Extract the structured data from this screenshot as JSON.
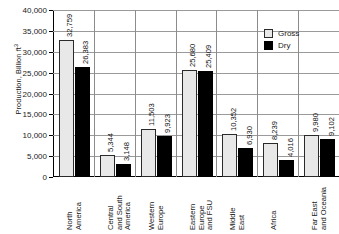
{
  "chart_data": {
    "type": "bar",
    "title": "",
    "xlabel": "",
    "ylabel": "Production, Billion ft",
    "ylabel_superscript": "3",
    "ylim": [
      0,
      40000
    ],
    "ytick_labels": [
      "40,000",
      "35,000",
      "30,000",
      "25,000",
      "20,000",
      "15,000",
      "10,000",
      "5,000",
      "0"
    ],
    "ytick_values": [
      40000,
      35000,
      30000,
      25000,
      20000,
      15000,
      10000,
      5000,
      0
    ],
    "grid": true,
    "legend_position": "top-right",
    "categories": [
      "North\nAmerica",
      "Central\nand South\nAmerica",
      "Western\nEurope",
      "Eastern\nEurope\nand FSU",
      "Middle\nEast",
      "Africa",
      "Far East\nand Oceania"
    ],
    "series": [
      {
        "name": "Gross",
        "color": "#e8e8e8",
        "values": [
          32759,
          5344,
          11503,
          25680,
          10352,
          8239,
          9980
        ],
        "labels": [
          "32,759",
          "5,344",
          "11,503",
          "25,680",
          "10,352",
          "8,239",
          "9,980"
        ]
      },
      {
        "name": "Dry",
        "color": "#000000",
        "values": [
          26383,
          3148,
          9923,
          25409,
          6930,
          4016,
          9102
        ],
        "labels": [
          "26,383",
          "3,148",
          "9,923",
          "25,409",
          "6,930",
          "4,016",
          "9,102"
        ]
      }
    ]
  }
}
